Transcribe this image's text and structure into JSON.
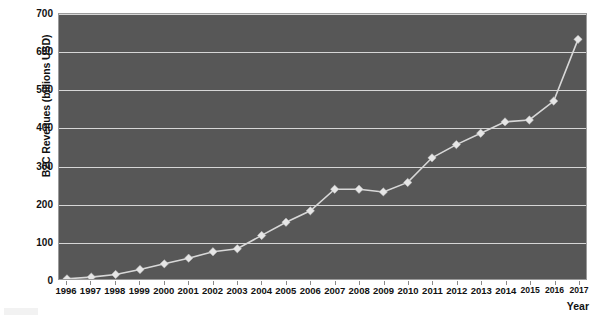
{
  "chart_data": {
    "type": "line",
    "title": "",
    "xlabel": "Year",
    "ylabel": "B2C Revenues (billions USD)",
    "categories": [
      "1996",
      "1997",
      "1998",
      "1999",
      "2000",
      "2001",
      "2002",
      "2003",
      "2004",
      "2005",
      "2006",
      "2007",
      "2008",
      "2009",
      "2010",
      "2011",
      "2012",
      "2013",
      "2014",
      "2015",
      "2016",
      "2017"
    ],
    "values": [
      0.5,
      5,
      12,
      25,
      40,
      55,
      72,
      80,
      115,
      150,
      180,
      237,
      237,
      230,
      255,
      320,
      355,
      385,
      415,
      420,
      470,
      633
    ],
    "series": [
      {
        "name": "B2C Revenues",
        "values": [
          0.5,
          5,
          12,
          25,
          40,
          55,
          72,
          80,
          115,
          150,
          180,
          237,
          237,
          230,
          255,
          320,
          355,
          385,
          415,
          420,
          470,
          633
        ]
      }
    ],
    "ylim": [
      0,
      700
    ],
    "yticks": [
      0,
      100,
      200,
      300,
      400,
      500,
      600,
      700
    ],
    "ytick_labels": [
      "0",
      "100",
      "200",
      "300",
      "400",
      "500",
      "600",
      "700"
    ],
    "grid": true,
    "legend": false,
    "marker": "diamond",
    "colors": {
      "plot_background": "#575757",
      "gridline": "#d6d6d6",
      "line": "#d8d8d8",
      "marker": "#e6e6e6",
      "text": "#111111",
      "page_background": "#ffffff"
    }
  }
}
